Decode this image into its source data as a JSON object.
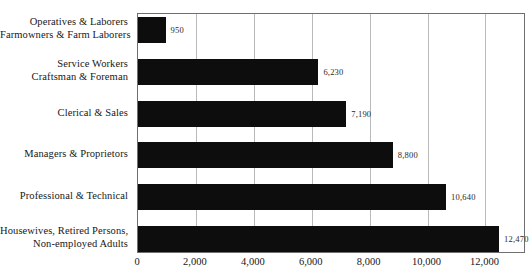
{
  "chart_data": {
    "type": "bar",
    "orientation": "horizontal",
    "title": "",
    "subtitle": "",
    "xlabel": "",
    "ylabel": "",
    "xlim": [
      0,
      13400
    ],
    "grid": "vertical",
    "legend": "none",
    "categories": [
      "Operatives & Laborers Farmowners & Farm Laborers",
      "Service Workers Craftsman & Foreman",
      "Clerical & Sales",
      "Managers & Proprietors",
      "Professional & Technical",
      "Housewives, Retired Persons, Non-employed Adults"
    ],
    "values": [
      950,
      6230,
      7190,
      8800,
      10640,
      12470
    ],
    "value_labels": [
      "950",
      "6,230",
      "7,190",
      "8,800",
      "10,640",
      "12,470"
    ],
    "xticks": [
      0,
      2000,
      4000,
      6000,
      8000,
      10000,
      12000
    ],
    "xtick_labels": [
      "0",
      "2,000",
      "4,000",
      "6,000",
      "8,000",
      "10,000",
      "12,000"
    ],
    "bar_color": "#0d0d0d",
    "grid_color": "#b9b9b9",
    "axis_color": "#6f6f6f",
    "background_color": "#ffffff"
  },
  "categories": [
    {
      "lines": [
        "Operatives & Laborers",
        "Farmowners & Farm Laborers"
      ],
      "line1": "Operatives & Laborers",
      "line2": "Farmowners & Farm Laborers",
      "value_label": "950"
    },
    {
      "lines": [
        "Service Workers",
        "Craftsman & Foreman"
      ],
      "line1": "Service Workers",
      "line2": "Craftsman & Foreman",
      "value_label": "6,230"
    },
    {
      "lines": [
        "Clerical & Sales"
      ],
      "line1": "Clerical & Sales",
      "line2": "",
      "value_label": "7,190"
    },
    {
      "lines": [
        "Managers & Proprietors"
      ],
      "line1": "Managers & Proprietors",
      "line2": "",
      "value_label": "8,800"
    },
    {
      "lines": [
        "Professional & Technical"
      ],
      "line1": "Professional & Technical",
      "line2": "",
      "value_label": "10,640"
    },
    {
      "lines": [
        "Housewives, Retired Persons,",
        "Non-employed Adults"
      ],
      "line1": "Housewives, Retired Persons,",
      "line2": "Non-employed Adults",
      "value_label": "12,470"
    }
  ],
  "xaxis": {
    "labels": [
      "0",
      "2,000",
      "4,000",
      "6,000",
      "8,000",
      "10,000",
      "12,000"
    ]
  }
}
